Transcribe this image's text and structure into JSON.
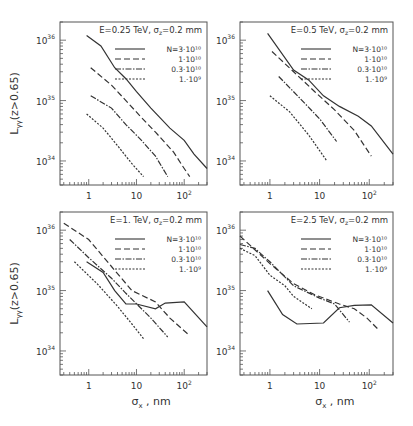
{
  "chart_data": [
    {
      "type": "line",
      "title": "E=0.25 TeV, σz=0.2 mm",
      "xlabel": "",
      "ylabel": "Lγγ(z>0.65)",
      "xscale": "log",
      "yscale": "log",
      "xlim": [
        0.25,
        300
      ],
      "ylim": [
        4e+33,
        2e+36
      ],
      "x_ticks": [
        "1",
        "10",
        "10²"
      ],
      "y_ticks": [
        "10³⁴",
        "10³⁵",
        "10³⁶"
      ],
      "series": [
        {
          "name": "N=3·10¹⁰",
          "style": "solid",
          "points": [
            [
              0.9,
              1.2e+36
            ],
            [
              1.8,
              8e+35
            ],
            [
              3.5,
              3.5e+35
            ],
            [
              6,
              2.3e+35
            ],
            [
              10,
              1.4e+35
            ],
            [
              20,
              7.5e+34
            ],
            [
              50,
              3.5e+34
            ],
            [
              100,
              2.2e+34
            ],
            [
              160,
              1.3e+34
            ],
            [
              300,
              7.5e+33
            ]
          ]
        },
        {
          "name": "1·10¹⁰",
          "style": "dashed",
          "points": [
            [
              1.1,
              3.5e+35
            ],
            [
              3,
              1.8e+35
            ],
            [
              6,
              1e+35
            ],
            [
              12,
              5.5e+34
            ],
            [
              25,
              3e+34
            ],
            [
              60,
              1.4e+34
            ],
            [
              90,
              8.5e+33
            ],
            [
              130,
              5.5e+33
            ]
          ]
        },
        {
          "name": "0.3·10¹⁰",
          "style": "dash-dot",
          "points": [
            [
              1.1,
              1.2e+35
            ],
            [
              3,
              7.5e+34
            ],
            [
              6,
              4e+34
            ],
            [
              12,
              2.3e+34
            ],
            [
              25,
              1.2e+34
            ],
            [
              45,
              5.5e+33
            ]
          ]
        },
        {
          "name": "1.·10⁹",
          "style": "dotted",
          "points": [
            [
              0.9,
              6e+34
            ],
            [
              2,
              3.5e+34
            ],
            [
              4,
              1.8e+34
            ],
            [
              8,
              9e+33
            ],
            [
              14,
              5.5e+33
            ]
          ]
        }
      ],
      "legend_position": "upper right"
    },
    {
      "type": "line",
      "title": "E=0.5 TeV, σz=0.2 mm",
      "xlabel": "",
      "ylabel": "",
      "xscale": "log",
      "yscale": "log",
      "xlim": [
        0.25,
        300
      ],
      "ylim": [
        4e+33,
        2e+36
      ],
      "x_ticks": [
        "1",
        "10",
        "10²"
      ],
      "y_ticks": [
        "10³⁴",
        "10³⁵",
        "10³⁶"
      ],
      "series": [
        {
          "name": "N=3·10¹⁰",
          "style": "solid",
          "points": [
            [
              0.9,
              1.3e+36
            ],
            [
              3,
              3.2e+35
            ],
            [
              6,
              2.2e+35
            ],
            [
              12,
              1.2e+35
            ],
            [
              25,
              8e+34
            ],
            [
              60,
              5.5e+34
            ],
            [
              110,
              3.8e+34
            ],
            [
              300,
              1.3e+34
            ]
          ]
        },
        {
          "name": "1·10¹⁰",
          "style": "dashed",
          "points": [
            [
              1.1,
              6.5e+35
            ],
            [
              3,
              3e+35
            ],
            [
              8,
              1.4e+35
            ],
            [
              20,
              7e+34
            ],
            [
              50,
              3.2e+34
            ],
            [
              110,
              1.2e+34
            ]
          ]
        },
        {
          "name": "0.3·10¹⁰",
          "style": "dash-dot",
          "points": [
            [
              1.5,
              2.5e+35
            ],
            [
              4,
              1.1e+35
            ],
            [
              10,
              5e+34
            ],
            [
              22,
              2.1e+34
            ]
          ]
        },
        {
          "name": "1.·10⁹",
          "style": "dotted",
          "points": [
            [
              1,
              1.2e+35
            ],
            [
              2.5,
              6.5e+34
            ],
            [
              6,
              2.7e+34
            ],
            [
              14,
              1e+34
            ]
          ]
        }
      ],
      "legend_position": "upper right"
    },
    {
      "type": "line",
      "title": "E=1. TeV, σz=0.2 mm",
      "xlabel": "σx , nm",
      "ylabel": "Lγγ(z>0.65)",
      "xscale": "log",
      "yscale": "log",
      "xlim": [
        0.25,
        300
      ],
      "ylim": [
        4e+33,
        2e+36
      ],
      "x_ticks": [
        "1",
        "10",
        "10²"
      ],
      "y_ticks": [
        "10³⁴",
        "10³⁵",
        "10³⁶"
      ],
      "series": [
        {
          "name": "N=3·10¹⁰",
          "style": "solid",
          "points": [
            [
              0.9,
              3e+35
            ],
            [
              2,
              2e+35
            ],
            [
              3.5,
              1e+35
            ],
            [
              6,
              6e+34
            ],
            [
              10,
              6e+34
            ],
            [
              25,
              5e+34
            ],
            [
              40,
              6.2e+34
            ],
            [
              100,
              6.5e+34
            ],
            [
              300,
              2.5e+34
            ]
          ]
        },
        {
          "name": "1·10¹⁰",
          "style": "dashed",
          "points": [
            [
              0.3,
              1.3e+36
            ],
            [
              1,
              7e+35
            ],
            [
              3,
              2.5e+35
            ],
            [
              8,
              1e+35
            ],
            [
              25,
              6.5e+34
            ],
            [
              50,
              3.5e+34
            ],
            [
              130,
              1.8e+34
            ]
          ]
        },
        {
          "name": "0.3·10¹⁰",
          "style": "dash-dot",
          "points": [
            [
              0.4,
              7e+35
            ],
            [
              1,
              3.5e+35
            ],
            [
              3,
              1.6e+35
            ],
            [
              6,
              9e+34
            ],
            [
              20,
              3.5e+34
            ],
            [
              45,
              1.7e+34
            ]
          ]
        },
        {
          "name": "1.·10⁹",
          "style": "dotted",
          "points": [
            [
              0.5,
              3e+35
            ],
            [
              1.5,
              1.3e+35
            ],
            [
              4,
              5.5e+34
            ],
            [
              8,
              2.8e+34
            ],
            [
              14,
              1.6e+34
            ]
          ]
        }
      ],
      "legend_position": "upper right"
    },
    {
      "type": "line",
      "title": "E=2.5 TeV, σz=0.2 mm",
      "xlabel": "σx , nm",
      "ylabel": "",
      "xscale": "log",
      "yscale": "log",
      "xlim": [
        0.25,
        300
      ],
      "ylim": [
        4e+33,
        2e+36
      ],
      "x_ticks": [
        "1",
        "10",
        "10²"
      ],
      "y_ticks": [
        "10³⁴",
        "10³⁵",
        "10³⁶"
      ],
      "series": [
        {
          "name": "N=3·10¹⁰",
          "style": "solid",
          "points": [
            [
              0.9,
              1e+35
            ],
            [
              1.8,
              4e+34
            ],
            [
              3.5,
              2.8e+34
            ],
            [
              12,
              2.9e+34
            ],
            [
              25,
              5.2e+34
            ],
            [
              50,
              5.7e+34
            ],
            [
              110,
              5.8e+34
            ],
            [
              300,
              2.9e+34
            ]
          ]
        },
        {
          "name": "1·10¹⁰",
          "style": "dashed",
          "points": [
            [
              0.25,
              8e+35
            ],
            [
              1,
              2.8e+35
            ],
            [
              3,
              1.3e+35
            ],
            [
              8,
              8.5e+34
            ],
            [
              25,
              6e+34
            ],
            [
              50,
              5e+34
            ],
            [
              90,
              3.5e+34
            ],
            [
              150,
              2.3e+34
            ]
          ]
        },
        {
          "name": "0.3·10¹⁰",
          "style": "dash-dot",
          "points": [
            [
              0.25,
              5.8e+35
            ],
            [
              0.5,
              5e+35
            ],
            [
              1,
              3e+35
            ],
            [
              3,
              1.2e+35
            ],
            [
              10,
              7.5e+34
            ],
            [
              20,
              6e+34
            ],
            [
              40,
              3e+34
            ]
          ]
        },
        {
          "name": "1.·10⁹",
          "style": "dotted",
          "points": [
            [
              0.25,
              5e+35
            ],
            [
              0.5,
              3.8e+35
            ],
            [
              1,
              1.8e+35
            ],
            [
              2,
              1.2e+35
            ],
            [
              3,
              8e+34
            ],
            [
              7,
              5e+34
            ]
          ]
        }
      ],
      "legend_position": "upper right"
    }
  ],
  "panels": [
    {
      "title": "E=0.25 TeV,  σ",
      "title_sub": "z",
      "title_tail": "=0.2 mm",
      "ylabel": "L",
      "ylabel_sub": "γγ",
      "ylabel_tail": "(z>0.65)",
      "xlabel": "",
      "xlabel_sub": "",
      "xlabel_tail": ""
    },
    {
      "title": "E=0.5 TeV,  σ",
      "title_sub": "z",
      "title_tail": "=0.2 mm",
      "ylabel": "",
      "ylabel_sub": "",
      "ylabel_tail": "",
      "xlabel": "",
      "xlabel_sub": "",
      "xlabel_tail": ""
    },
    {
      "title": "E=1. TeV,  σ",
      "title_sub": "z",
      "title_tail": "=0.2 mm",
      "ylabel": "L",
      "ylabel_sub": "γγ",
      "ylabel_tail": "(z>0.65)",
      "xlabel": "σ",
      "xlabel_sub": "x",
      "xlabel_tail": " , nm"
    },
    {
      "title": "E=2.5 TeV,  σ",
      "title_sub": "z",
      "title_tail": "=0.2 mm",
      "ylabel": "",
      "ylabel_sub": "",
      "ylabel_tail": "",
      "xlabel": "σ",
      "xlabel_sub": "x",
      "xlabel_tail": " , nm"
    }
  ],
  "legend": [
    "N=3·10¹⁰",
    "1·10¹⁰",
    "0.3·10¹⁰",
    "1.·10⁹"
  ],
  "y_tick_labels": [
    "10³⁶",
    "10³⁵",
    "10³⁴"
  ],
  "x_tick_labels": [
    "1",
    "10",
    "10²"
  ]
}
